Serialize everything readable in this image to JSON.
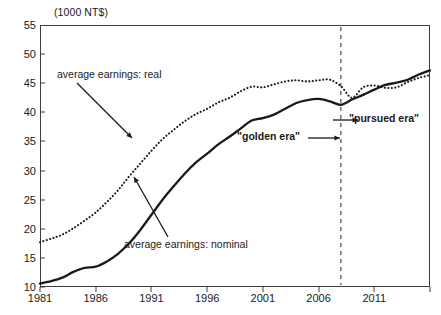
{
  "chart_data": {
    "type": "line",
    "title": "(1000 NT$)",
    "xlabel": "",
    "ylabel": "",
    "unit_label": "(1000 NT$)",
    "xlim": [
      1981,
      2016
    ],
    "ylim": [
      10,
      55
    ],
    "yticks": [
      10,
      15,
      20,
      25,
      30,
      35,
      40,
      45,
      50,
      55
    ],
    "xticks": [
      1981,
      1986,
      1991,
      1996,
      2001,
      2006,
      2011,
      2016
    ],
    "xtick_labels": [
      "1981",
      "1986",
      "1991",
      "1996",
      "2001",
      "2006",
      "2011",
      ""
    ],
    "grid": false,
    "legend_position": "none",
    "x": [
      1981,
      1982,
      1983,
      1984,
      1985,
      1986,
      1987,
      1988,
      1989,
      1990,
      1991,
      1992,
      1993,
      1994,
      1995,
      1996,
      1997,
      1998,
      1999,
      2000,
      2001,
      2002,
      2003,
      2004,
      2005,
      2006,
      2007,
      2008,
      2009,
      2010,
      2011,
      2012,
      2013,
      2014,
      2015,
      2016
    ],
    "series": [
      {
        "name": "average earnings: real",
        "style": "dotted",
        "color": "#1a1a1a",
        "values": [
          17.7,
          18.3,
          19.0,
          20.1,
          21.4,
          22.8,
          24.6,
          26.6,
          29.0,
          31.2,
          33.4,
          35.4,
          37.0,
          38.5,
          39.7,
          40.6,
          41.7,
          42.5,
          43.6,
          44.4,
          44.3,
          44.8,
          45.3,
          45.5,
          45.3,
          45.5,
          45.6,
          44.5,
          42.5,
          44.3,
          44.6,
          44.2,
          44.3,
          45.2,
          45.9,
          46.4
        ]
      },
      {
        "name": "average earnings: nominal",
        "style": "solid",
        "color": "#1a1a1a",
        "values": [
          10.6,
          11.0,
          11.6,
          12.6,
          13.3,
          13.5,
          14.4,
          15.7,
          17.5,
          19.8,
          22.4,
          25.0,
          27.3,
          29.5,
          31.4,
          32.9,
          34.5,
          35.8,
          37.2,
          38.6,
          39.0,
          39.6,
          40.6,
          41.6,
          42.1,
          42.3,
          41.9,
          41.3,
          42.2,
          43.0,
          43.9,
          44.7,
          45.1,
          45.6,
          46.5,
          47.2
        ]
      }
    ],
    "annotations": [
      {
        "name": "real-label",
        "text": "average earnings: real"
      },
      {
        "name": "nominal-label",
        "text": "average earnings: nominal"
      },
      {
        "name": "golden-era-label",
        "text": "\"golden era\""
      },
      {
        "name": "pursued-era-label",
        "text": "\"pursued era\""
      }
    ],
    "divider_year": 2008
  }
}
